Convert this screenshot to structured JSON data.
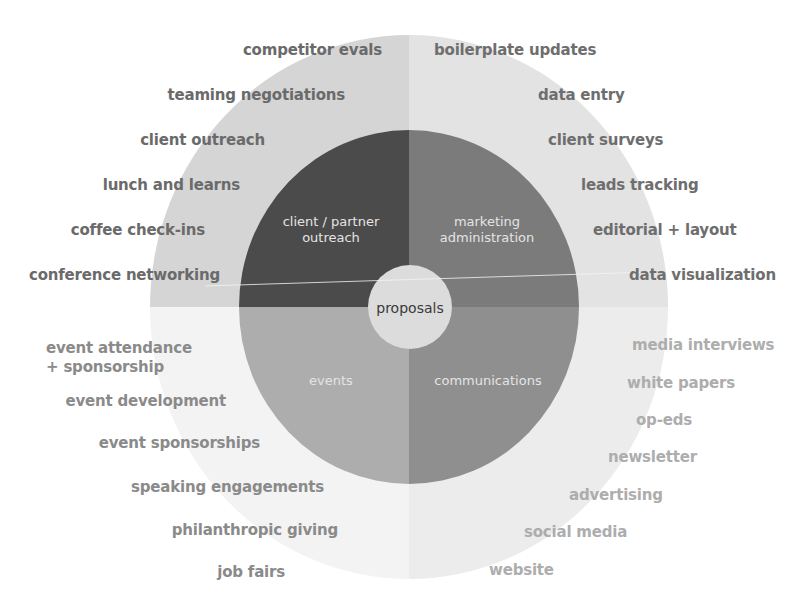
{
  "diagram": {
    "center": {
      "label": "proposals",
      "color": "#dcdcdc"
    },
    "segments": [
      {
        "id": "client-partner-outreach",
        "label_line1": "client / partner",
        "label_line2": "outreach",
        "inner_color": "#4b4b4b",
        "outer_color": "#d5d5d5"
      },
      {
        "id": "marketing-administration",
        "label_line1": "marketing",
        "label_line2": "administration",
        "inner_color": "#7b7b7b",
        "outer_color": "#e3e3e3"
      },
      {
        "id": "events",
        "label_line1": "events",
        "label_line2": "",
        "inner_color": "#adadad",
        "outer_color": "#f3f3f3"
      },
      {
        "id": "communications",
        "label_line1": "communications",
        "label_line2": "",
        "inner_color": "#8f8f8f",
        "outer_color": "#ececec"
      }
    ],
    "upper_left_items": [
      "competitor evals",
      "teaming negotiations",
      "client outreach",
      "lunch and learns",
      "coffee check-ins",
      "conference networking"
    ],
    "upper_right_items": [
      "boilerplate updates",
      "data entry",
      "client surveys",
      "leads tracking",
      "editorial + layout",
      "data visualization"
    ],
    "lower_left_items": [
      "event attendance",
      "+ sponsorship",
      "event development",
      "event sponsorships",
      "speaking engagements",
      "philanthropic giving",
      "job fairs"
    ],
    "lower_right_items": [
      "media interviews",
      "white papers",
      "op-eds",
      "newsletter",
      "advertising",
      "social media",
      "website"
    ]
  }
}
